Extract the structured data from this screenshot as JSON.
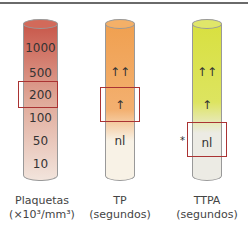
{
  "columns": [
    {
      "name": "plaquetas",
      "title": "Plaquetas",
      "unit": "(×10³/mm³)",
      "labels": [
        "1000",
        "500",
        "200",
        "100",
        "50",
        "10"
      ],
      "color_top": "#c8574a",
      "color_bottom": "#f2e4dc"
    },
    {
      "name": "tp",
      "title": "TP",
      "unit": "(segundos)",
      "labels": [
        "↑↑",
        "↑",
        "nl"
      ],
      "color_top": "#f0a050",
      "color_bottom": "#f8f2e6"
    },
    {
      "name": "ttpa",
      "title": "TTPA",
      "unit": "(segundos)",
      "labels": [
        "↑↑",
        "↑",
        "nl"
      ],
      "color_top": "#d8e040",
      "color_bottom": "#ecebe4",
      "marker": "*"
    }
  ],
  "box_color": "#aa3333"
}
